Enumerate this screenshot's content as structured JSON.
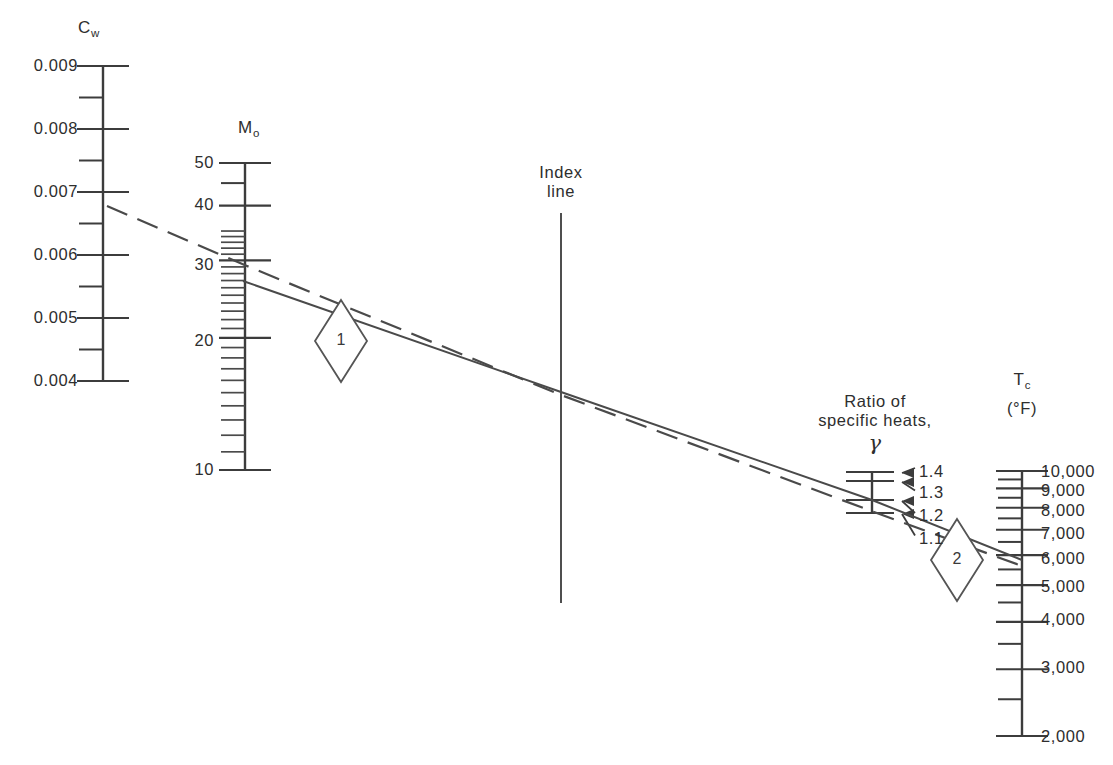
{
  "figure": {
    "type": "nomogram",
    "background_color": "#ffffff",
    "line_color": "#3c3c3c",
    "width": 1113,
    "height": 765
  },
  "index_line": {
    "label_line1": "Index",
    "label_line2": "line",
    "x": 561,
    "y_top": 213,
    "y_bottom": 603
  },
  "scales": [
    {
      "id": "cw",
      "title": "C",
      "title_sub": "w",
      "axis_x": 103,
      "y_top": 66,
      "y_bottom": 381,
      "scale_type": "linear",
      "value_top": 0.009,
      "value_bottom": 0.004,
      "major_labels": [
        "0.009",
        "0.008",
        "0.007",
        "0.006",
        "0.005",
        "0.004"
      ],
      "major_values": [
        0.009,
        0.008,
        0.007,
        0.006,
        0.005,
        0.004
      ],
      "minor_values": [
        0.0085,
        0.0075,
        0.0065,
        0.0055,
        0.0045
      ],
      "label_side": "left"
    },
    {
      "id": "mo",
      "title": "M",
      "title_sub": "o",
      "axis_x": 245,
      "y_top": 163,
      "y_bottom": 470,
      "scale_type": "log",
      "value_top": 50,
      "value_bottom": 10,
      "major_labels": [
        "50",
        "40",
        "30",
        "20",
        "10"
      ],
      "major_values": [
        50,
        40,
        30,
        20,
        10
      ],
      "minor_values": [
        45,
        35,
        34,
        33,
        32,
        31,
        29,
        28,
        27,
        26,
        25,
        24,
        23,
        22,
        21,
        19,
        18,
        17,
        16,
        15,
        14,
        13,
        12,
        11
      ],
      "label_side": "left"
    },
    {
      "id": "gamma",
      "title_line1": "Ratio of",
      "title_line2": "specific heats,",
      "title_symbol": "γ",
      "axis_x": 872,
      "y_top": 472,
      "y_bottom": 513,
      "scale_type": "custom",
      "major_labels": [
        "1.4",
        "1.3",
        "1.2",
        "1.1"
      ],
      "major_values": [
        1.4,
        1.3,
        1.2,
        1.1
      ],
      "tick_y": [
        472,
        481,
        500,
        513
      ],
      "label_side": "right-arrow"
    },
    {
      "id": "tc",
      "title": "T",
      "title_sub": "c",
      "title_units": "(°F)",
      "axis_x": 1022,
      "y_top": 471,
      "y_bottom": 736,
      "scale_type": "log",
      "value_top": 10000,
      "value_bottom": 2000,
      "major_labels": [
        "10,000",
        "9,000",
        "8,000",
        "7,000",
        "6,000",
        "5,000",
        "4,000",
        "3,000",
        "2,000"
      ],
      "major_values": [
        10000,
        9000,
        8000,
        7000,
        6000,
        5000,
        4000,
        3000,
        2000
      ],
      "minor_values": [
        9500,
        8500,
        7500,
        6500,
        5500,
        4500,
        3500,
        2500
      ],
      "label_side": "right"
    }
  ],
  "construction_lines": [
    {
      "id": "line-1",
      "style": "dashed",
      "description": "C_w to M_o to index line",
      "points": [
        [
          107,
          206
        ],
        [
          247,
          266
        ],
        [
          561,
          395
        ],
        [
          874,
          512
        ],
        [
          1022,
          566
        ]
      ]
    },
    {
      "id": "line-2",
      "style": "solid",
      "description": "M_o through index line, gamma and T_c",
      "points": [
        [
          243,
          281
        ],
        [
          561,
          392
        ],
        [
          872,
          500
        ],
        [
          1022,
          560
        ]
      ]
    }
  ],
  "markers": [
    {
      "id": "marker-1",
      "label": "1",
      "cx": 341,
      "cy": 341,
      "rx": 26,
      "ry": 41
    },
    {
      "id": "marker-2",
      "label": "2",
      "cx": 957,
      "cy": 560,
      "rx": 26,
      "ry": 41
    }
  ]
}
